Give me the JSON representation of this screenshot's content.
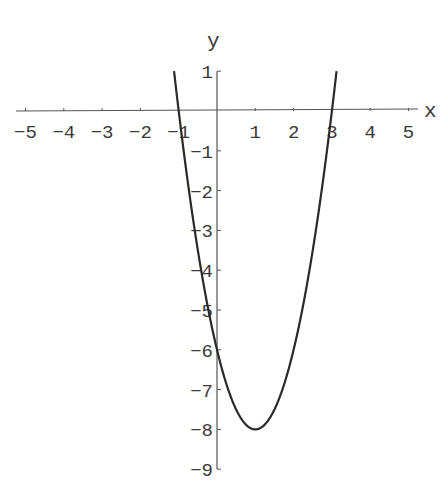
{
  "chart_data": {
    "type": "line",
    "title": "",
    "function": "y = 2x^2 - 4x - 6",
    "xlabel": "x",
    "ylabel": "y",
    "xlim": [
      -5,
      5
    ],
    "ylim": [
      -9,
      1
    ],
    "x_ticks": [
      -5,
      -4,
      -3,
      -2,
      -1,
      1,
      2,
      3,
      4,
      5
    ],
    "y_ticks": [
      1,
      -1,
      -2,
      -3,
      -4,
      -5,
      -6,
      -7,
      -8,
      -9
    ],
    "grid": false,
    "legend": null,
    "series": [
      {
        "name": "parabola",
        "x": [
          -1.12,
          -1,
          -0.5,
          0,
          0.5,
          1,
          1.5,
          2,
          2.5,
          3,
          3.12
        ],
        "y": [
          1,
          0,
          -3.5,
          -6,
          -7.5,
          -8,
          -7.5,
          -6,
          -3.5,
          0,
          1
        ]
      }
    ],
    "annotations": {
      "x_intercepts": [
        -1,
        3
      ],
      "y_intercept": -6,
      "vertex": [
        1,
        -8
      ]
    },
    "line_color": "#2a2a2a",
    "axis_color": "#555555"
  }
}
